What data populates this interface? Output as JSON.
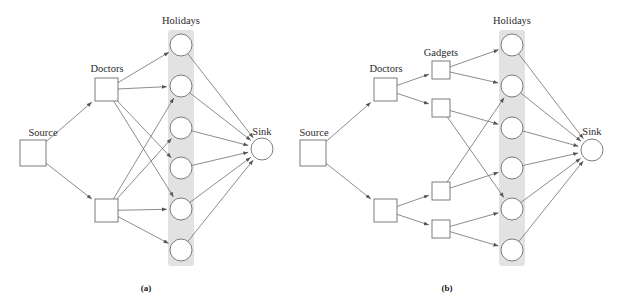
{
  "figure": {
    "width": 617,
    "height": 306,
    "background": "#ffffff",
    "node_stroke": "#6e6e6e",
    "edge_stroke": "#707070",
    "band_fill": "#e2e2e2",
    "text_color": "#2b2b2b"
  },
  "panels": [
    {
      "id": "a",
      "caption": "(a)",
      "caption_pos": {
        "x": 146,
        "y": 291
      },
      "labels": {
        "source": "Source",
        "doctors": "Doctors",
        "holidays": "Holidays",
        "sink": "Sink"
      },
      "label_pos": {
        "source": {
          "x": 43,
          "y": 136
        },
        "doctors": {
          "x": 107,
          "y": 72
        },
        "holidays": {
          "x": 181,
          "y": 24
        },
        "sink": {
          "x": 262,
          "y": 135
        }
      },
      "band": {
        "x": 168,
        "y": 30,
        "width": 26,
        "height": 236
      },
      "nodes": {
        "source": {
          "x": 20,
          "y": 140,
          "w": 26,
          "h": 26
        },
        "doctors": [
          {
            "x": 95,
            "y": 78,
            "w": 23,
            "h": 23
          },
          {
            "x": 95,
            "y": 199,
            "w": 23,
            "h": 23
          }
        ],
        "holidays": [
          {
            "cx": 181,
            "cy": 45,
            "r": 11
          },
          {
            "cx": 181,
            "cy": 86,
            "r": 11
          },
          {
            "cx": 181,
            "cy": 128,
            "r": 11
          },
          {
            "cx": 181,
            "cy": 168,
            "r": 11
          },
          {
            "cx": 181,
            "cy": 209,
            "r": 11
          },
          {
            "cx": 181,
            "cy": 250,
            "r": 11
          }
        ],
        "sink": {
          "cx": 262,
          "cy": 149,
          "r": 11
        }
      },
      "edges": [
        {
          "from": "source",
          "to": "doctors.0"
        },
        {
          "from": "source",
          "to": "doctors.1"
        },
        {
          "from": "doctors.0",
          "to": "holidays.0"
        },
        {
          "from": "doctors.0",
          "to": "holidays.1"
        },
        {
          "from": "doctors.0",
          "to": "holidays.3"
        },
        {
          "from": "doctors.0",
          "to": "holidays.4"
        },
        {
          "from": "doctors.1",
          "to": "holidays.1"
        },
        {
          "from": "doctors.1",
          "to": "holidays.2"
        },
        {
          "from": "doctors.1",
          "to": "holidays.4"
        },
        {
          "from": "doctors.1",
          "to": "holidays.5"
        },
        {
          "from": "holidays.0",
          "to": "sink"
        },
        {
          "from": "holidays.1",
          "to": "sink"
        },
        {
          "from": "holidays.2",
          "to": "sink"
        },
        {
          "from": "holidays.3",
          "to": "sink"
        },
        {
          "from": "holidays.4",
          "to": "sink"
        },
        {
          "from": "holidays.5",
          "to": "sink"
        }
      ]
    },
    {
      "id": "b",
      "caption": "(b)",
      "caption_pos": {
        "x": 447,
        "y": 291
      },
      "labels": {
        "source": "Source",
        "doctors": "Doctors",
        "gadgets": "Gadgets",
        "holidays": "Holidays",
        "sink": "Sink"
      },
      "label_pos": {
        "source": {
          "x": 314,
          "y": 136
        },
        "doctors": {
          "x": 386,
          "y": 72
        },
        "gadgets": {
          "x": 441,
          "y": 56
        },
        "holidays": {
          "x": 512,
          "y": 24
        },
        "sink": {
          "x": 592,
          "y": 135
        }
      },
      "band": {
        "x": 499,
        "y": 30,
        "width": 26,
        "height": 236
      },
      "nodes": {
        "source": {
          "x": 300,
          "y": 140,
          "w": 26,
          "h": 26
        },
        "doctors": [
          {
            "x": 374,
            "y": 78,
            "w": 23,
            "h": 23
          },
          {
            "x": 374,
            "y": 199,
            "w": 23,
            "h": 23
          }
        ],
        "gadgets": [
          {
            "x": 432,
            "y": 61,
            "w": 18,
            "h": 18
          },
          {
            "x": 432,
            "y": 99,
            "w": 18,
            "h": 18
          },
          {
            "x": 432,
            "y": 182,
            "w": 18,
            "h": 18
          },
          {
            "x": 432,
            "y": 220,
            "w": 18,
            "h": 18
          }
        ],
        "holidays": [
          {
            "cx": 512,
            "cy": 45,
            "r": 11
          },
          {
            "cx": 512,
            "cy": 86,
            "r": 11
          },
          {
            "cx": 512,
            "cy": 128,
            "r": 11
          },
          {
            "cx": 512,
            "cy": 168,
            "r": 11
          },
          {
            "cx": 512,
            "cy": 209,
            "r": 11
          },
          {
            "cx": 512,
            "cy": 250,
            "r": 11
          }
        ],
        "sink": {
          "cx": 592,
          "cy": 150,
          "r": 11
        }
      },
      "edges": [
        {
          "from": "source",
          "to": "doctors.0"
        },
        {
          "from": "source",
          "to": "doctors.1"
        },
        {
          "from": "doctors.0",
          "to": "gadgets.0"
        },
        {
          "from": "doctors.0",
          "to": "gadgets.1"
        },
        {
          "from": "doctors.1",
          "to": "gadgets.2"
        },
        {
          "from": "doctors.1",
          "to": "gadgets.3"
        },
        {
          "from": "gadgets.0",
          "to": "holidays.0"
        },
        {
          "from": "gadgets.0",
          "to": "holidays.1"
        },
        {
          "from": "gadgets.1",
          "to": "holidays.2"
        },
        {
          "from": "gadgets.1",
          "to": "holidays.4"
        },
        {
          "from": "gadgets.2",
          "to": "holidays.1"
        },
        {
          "from": "gadgets.2",
          "to": "holidays.3"
        },
        {
          "from": "gadgets.3",
          "to": "holidays.4"
        },
        {
          "from": "gadgets.3",
          "to": "holidays.5"
        },
        {
          "from": "holidays.0",
          "to": "sink"
        },
        {
          "from": "holidays.1",
          "to": "sink"
        },
        {
          "from": "holidays.2",
          "to": "sink"
        },
        {
          "from": "holidays.3",
          "to": "sink"
        },
        {
          "from": "holidays.4",
          "to": "sink"
        },
        {
          "from": "holidays.5",
          "to": "sink"
        }
      ]
    }
  ]
}
